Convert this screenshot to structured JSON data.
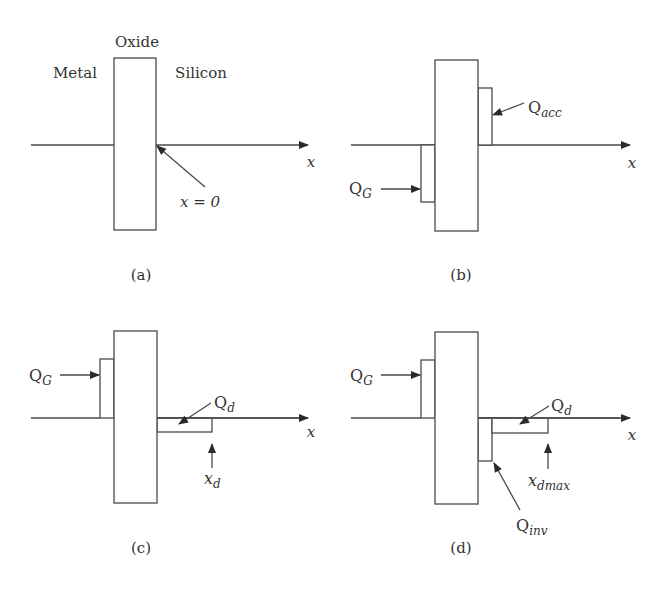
{
  "figure": {
    "panels": [
      {
        "id": "a",
        "caption": "(a)",
        "region_labels": {
          "metal": "Metal",
          "oxide": "Oxide",
          "silicon": "Silicon"
        },
        "axis_label": "x",
        "annotations": [
          {
            "label": "x = 0",
            "points_to": "oxide-silicon interface"
          }
        ]
      },
      {
        "id": "b",
        "caption": "(b)",
        "axis_label": "x",
        "charges": [
          {
            "name": "Q_G",
            "base": "Q",
            "sub": "G",
            "side": "metal",
            "sign": "negative"
          },
          {
            "name": "Q_acc",
            "base": "Q",
            "sub": "acc",
            "side": "silicon",
            "sign": "positive"
          }
        ]
      },
      {
        "id": "c",
        "caption": "(c)",
        "axis_label": "x",
        "charges": [
          {
            "name": "Q_G",
            "base": "Q",
            "sub": "G",
            "side": "metal",
            "sign": "positive"
          },
          {
            "name": "Q_d",
            "base": "Q",
            "sub": "d",
            "side": "silicon",
            "sign": "negative"
          }
        ],
        "markers": [
          {
            "name": "x_d",
            "base": "x",
            "sub": "d"
          }
        ]
      },
      {
        "id": "d",
        "caption": "(d)",
        "axis_label": "x",
        "charges": [
          {
            "name": "Q_G",
            "base": "Q",
            "sub": "G",
            "side": "metal",
            "sign": "positive"
          },
          {
            "name": "Q_d",
            "base": "Q",
            "sub": "d",
            "side": "silicon",
            "sign": "negative"
          },
          {
            "name": "Q_inv",
            "base": "Q",
            "sub": "inv",
            "side": "silicon",
            "sign": "negative"
          }
        ],
        "markers": [
          {
            "name": "x_dmax",
            "base": "x",
            "sub": "dmax"
          }
        ]
      }
    ]
  },
  "colors": {
    "line": "#4a4a4a",
    "text": "#333333",
    "background": "#ffffff"
  }
}
